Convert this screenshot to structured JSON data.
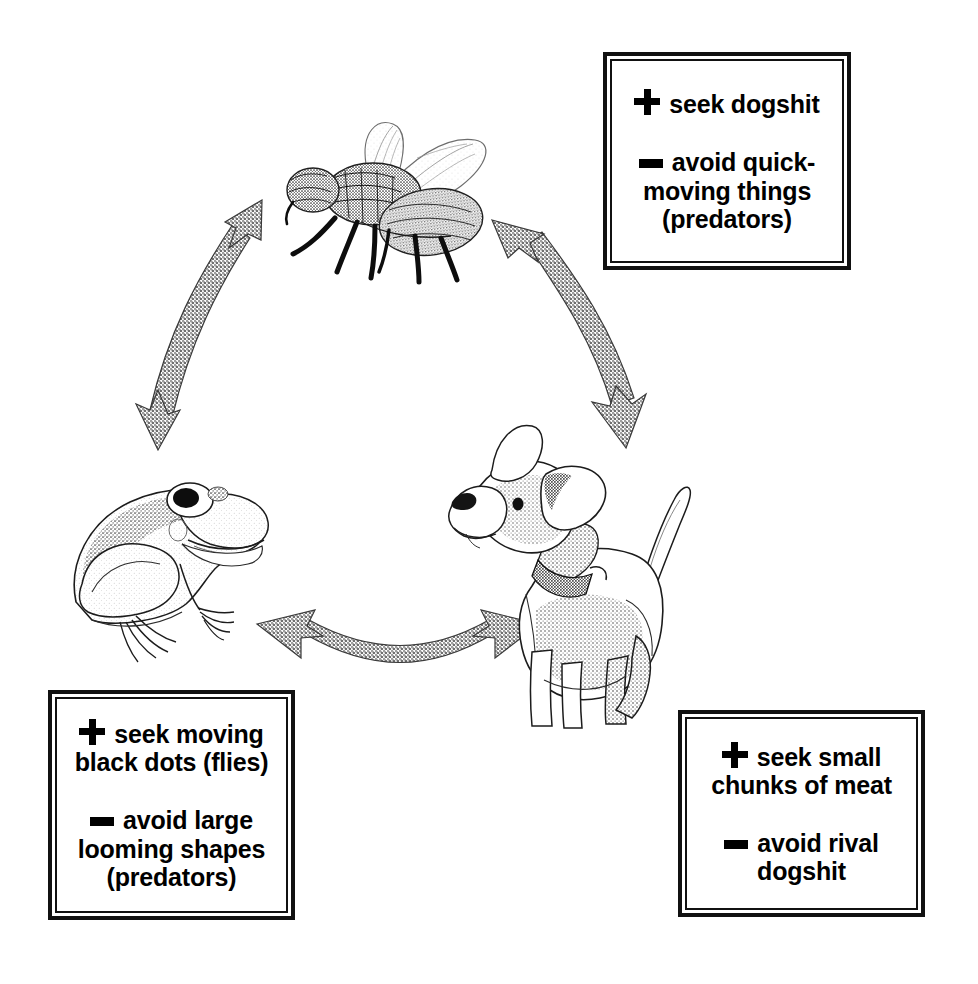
{
  "diagram": {
    "background_color": "#ffffff",
    "ink_color": "#000000"
  },
  "nodes": [
    {
      "id": "fly",
      "label": "fly",
      "icon": "fly-illustration"
    },
    {
      "id": "dog",
      "label": "dog",
      "icon": "dog-illustration"
    },
    {
      "id": "frog",
      "label": "frog",
      "icon": "frog-illustration"
    }
  ],
  "arrows": [
    {
      "id": "frog-fly",
      "style": "double-headed-curved",
      "from": "frog",
      "to": "fly"
    },
    {
      "id": "fly-dog",
      "style": "double-headed-curved",
      "from": "fly",
      "to": "dog"
    },
    {
      "id": "frog-dog",
      "style": "double-headed-curved",
      "from": "frog",
      "to": "dog"
    }
  ],
  "callouts": {
    "fly": {
      "name": "fly-rules",
      "seek": {
        "glyph": "plus-icon",
        "text": "seek dogshit"
      },
      "avoid": {
        "glyph": "minus-icon",
        "text": "avoid quick-\nmoving things\n(predators)"
      }
    },
    "frog": {
      "name": "frog-rules",
      "seek": {
        "glyph": "plus-icon",
        "text": "seek moving\nblack dots (flies)"
      },
      "avoid": {
        "glyph": "minus-icon",
        "text": "avoid large\nlooming shapes\n(predators)"
      }
    },
    "dog": {
      "name": "dog-rules",
      "seek": {
        "glyph": "plus-icon",
        "text": "seek small\nchunks of meat"
      },
      "avoid": {
        "glyph": "minus-icon",
        "text": "avoid rival\ndogshit"
      }
    }
  }
}
